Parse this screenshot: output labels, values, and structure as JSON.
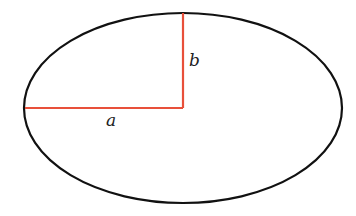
{
  "diagram": {
    "ellipse": {
      "cx": 183,
      "cy": 108,
      "rx": 159,
      "ry": 95,
      "stroke": "#111111",
      "stroke_width": 2.2
    },
    "semi_major_axis": {
      "label": "a",
      "x1": 25,
      "y1": 108,
      "x2": 183,
      "y2": 108,
      "label_x": 106,
      "label_y": 126,
      "color": "#e8503a"
    },
    "semi_minor_axis": {
      "label": "b",
      "x1": 183,
      "y1": 13,
      "x2": 183,
      "y2": 108,
      "label_x": 189,
      "label_y": 66,
      "color": "#e8503a"
    }
  }
}
